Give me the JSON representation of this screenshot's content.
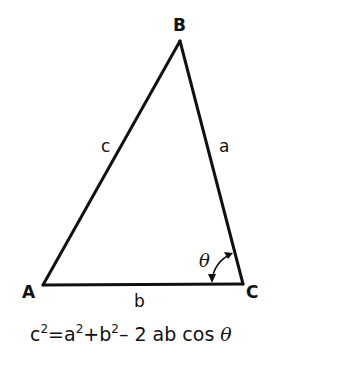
{
  "diagram": {
    "type": "triangle",
    "vertices": {
      "A": {
        "label": "A",
        "x": 43,
        "y": 285
      },
      "B": {
        "label": "B",
        "x": 180,
        "y": 41
      },
      "C": {
        "label": "C",
        "x": 243,
        "y": 284
      }
    },
    "sides": {
      "a": {
        "label": "a",
        "between": "B-C"
      },
      "b": {
        "label": "b",
        "between": "A-C"
      },
      "c": {
        "label": "c",
        "between": "A-B"
      }
    },
    "angle": {
      "label": "θ",
      "at": "C"
    },
    "formula": {
      "lhs": "c",
      "lhs_exp": "2",
      "eq": "=",
      "t1": "a",
      "t1_exp": "2",
      "plus": "+",
      "t2": "b",
      "t2_exp": "2",
      "rest": "– 2 ab cos ",
      "theta": "θ"
    }
  }
}
